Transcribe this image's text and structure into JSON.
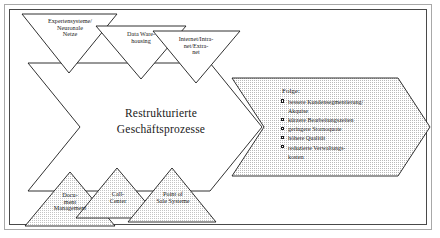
{
  "diagram": {
    "title_center": {
      "line1": "Restrukturierte",
      "line2": "Geschäftsprozesse"
    },
    "top_triangles": [
      {
        "name": "expertensysteme",
        "lines": [
          "Expertensysteme/",
          "Neuronale",
          "Netze"
        ]
      },
      {
        "name": "data-warehousing",
        "lines": [
          "Data Ware-",
          "housing"
        ]
      },
      {
        "name": "internet-intranet-extranet",
        "lines": [
          "Internet/Intra-",
          "net/Extra-",
          "net"
        ]
      }
    ],
    "bottom_triangles": [
      {
        "name": "document-management",
        "lines": [
          "Docu-",
          "ment",
          "Management"
        ]
      },
      {
        "name": "call-center",
        "lines": [
          "Call-",
          "Center"
        ]
      },
      {
        "name": "point-of-sale",
        "lines": [
          "Point of",
          "Sale Systeme"
        ]
      }
    ],
    "result_box": {
      "heading": "Folge:",
      "items": [
        {
          "line1": "bessere Kundensegmentierung/",
          "line2": "Akquise"
        },
        {
          "line1": "kürzere Bearbeitungszeiten",
          "line2": ""
        },
        {
          "line1": "geringere Stornoquote",
          "line2": ""
        },
        {
          "line1": "höhere Qualität",
          "line2": ""
        },
        {
          "line1": "reduzierte Verwaltungs-",
          "line2": "kosten"
        }
      ]
    },
    "colors": {
      "stroke": "#1a1a1a",
      "fill_white": "#ffffff",
      "fill_stipple": "#d8d8d8",
      "frame_outer": "#a8a8a8"
    }
  }
}
